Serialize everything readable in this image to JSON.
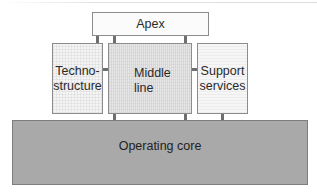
{
  "diagram": {
    "type": "organizational-structure",
    "nodes": {
      "apex": {
        "label": "Apex"
      },
      "technostructure": {
        "label": "Techno-\nstructure",
        "line1": "Techno-",
        "line2": "structure"
      },
      "middle_line": {
        "label": "Middle\nline",
        "line1": "Middle",
        "line2": "line"
      },
      "support_services": {
        "label": "Support\nservices",
        "line1": "Support",
        "line2": "services"
      },
      "operating_core": {
        "label": "Operating core"
      }
    },
    "edges": [
      {
        "from": "apex",
        "to": "technostructure"
      },
      {
        "from": "apex",
        "to": "middle_line"
      },
      {
        "from": "apex",
        "to": "middle_line"
      },
      {
        "from": "technostructure",
        "to": "middle_line"
      },
      {
        "from": "middle_line",
        "to": "support_services"
      },
      {
        "from": "middle_line",
        "to": "operating_core"
      },
      {
        "from": "middle_line",
        "to": "operating_core"
      },
      {
        "from": "support_services",
        "to": "operating_core"
      }
    ],
    "colors": {
      "apex_fill": "#fbfbfb",
      "technostructure_fill": "#f4f4f4",
      "middle_line_fill": "#e6e6e6",
      "support_services_fill": "#f6f6f6",
      "operating_core_fill": "#a9a9a9",
      "connector": "#6e6e6e",
      "border": "#8c8c8c"
    }
  }
}
